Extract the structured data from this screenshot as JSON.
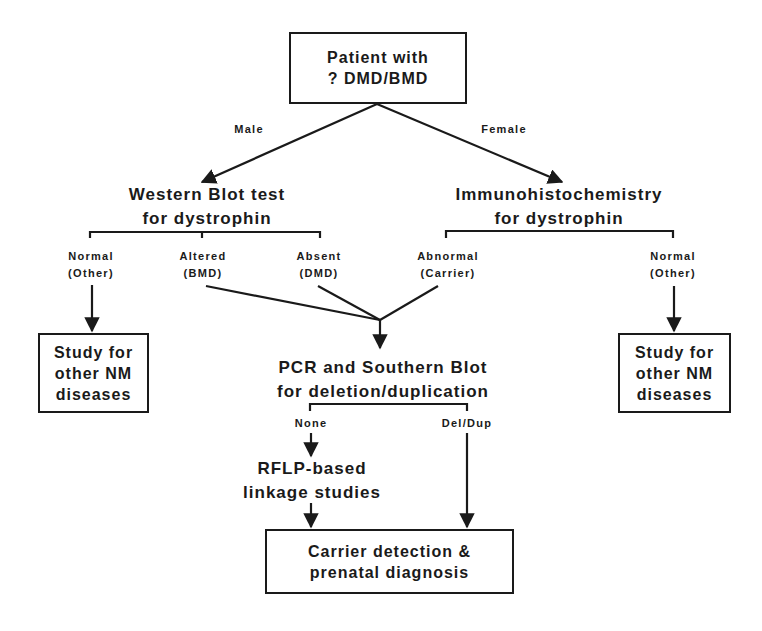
{
  "diagram": {
    "type": "flowchart",
    "nodes": {
      "start": {
        "lines": [
          "Patient  with",
          "? DMD/BMD"
        ]
      },
      "western_blot": {
        "lines": [
          "Western  Blot  test",
          "for  dystrophin"
        ]
      },
      "immuno": {
        "lines": [
          "Immunohistochemistry",
          "for  dystrophin"
        ]
      },
      "study_left": {
        "lines": [
          "Study  for",
          "other  NM",
          "diseases"
        ]
      },
      "study_right": {
        "lines": [
          "Study  for",
          "other  NM",
          "diseases"
        ]
      },
      "pcr": {
        "lines": [
          "PCR  and  Southern  Blot",
          "for   deletion/duplication"
        ]
      },
      "rflp": {
        "lines": [
          "RFLP-based",
          "linkage   studies"
        ]
      },
      "carrier": {
        "lines": [
          "Carrier   detection   &",
          "prenatal   diagnosis"
        ]
      }
    },
    "edge_labels": {
      "male": "Male",
      "female": "Female",
      "wb_normal": [
        "Normal",
        "(Other)"
      ],
      "wb_altered": [
        "Altered",
        "(BMD)"
      ],
      "wb_absent": [
        "Absent",
        "(DMD)"
      ],
      "ih_abnormal": [
        "Abnormal",
        "(Carrier)"
      ],
      "ih_normal": [
        "Normal",
        "(Other)"
      ],
      "pcr_none": "None",
      "pcr_deldup": "Del/Dup"
    },
    "edges": [
      {
        "from": "start",
        "to": "western_blot",
        "label": "Male"
      },
      {
        "from": "start",
        "to": "immuno",
        "label": "Female"
      },
      {
        "from": "western_blot",
        "to": "study_left",
        "label": "Normal (Other)"
      },
      {
        "from": "western_blot",
        "to": "pcr",
        "label": "Altered (BMD)"
      },
      {
        "from": "western_blot",
        "to": "pcr",
        "label": "Absent (DMD)"
      },
      {
        "from": "immuno",
        "to": "pcr",
        "label": "Abnormal (Carrier)"
      },
      {
        "from": "immuno",
        "to": "study_right",
        "label": "Normal (Other)"
      },
      {
        "from": "pcr",
        "to": "rflp",
        "label": "None"
      },
      {
        "from": "pcr",
        "to": "carrier",
        "label": "Del/Dup"
      },
      {
        "from": "rflp",
        "to": "carrier",
        "label": ""
      }
    ],
    "colors": {
      "ink": "#1a1a1a",
      "background": "#ffffff"
    }
  }
}
